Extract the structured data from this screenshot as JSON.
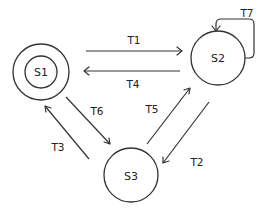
{
  "diagram": {
    "type": "state-transition",
    "states": [
      {
        "id": "S1",
        "label": "S1",
        "cx": 41,
        "cy": 72,
        "r": 28,
        "inner_r": 16,
        "accepting": true
      },
      {
        "id": "S2",
        "label": "S2",
        "cx": 218,
        "cy": 58,
        "r": 27,
        "accepting": false
      },
      {
        "id": "S3",
        "label": "S3",
        "cx": 131,
        "cy": 175,
        "r": 27,
        "accepting": false
      }
    ],
    "transitions": [
      {
        "id": "T1",
        "label": "T1",
        "from": "S1",
        "to": "S2"
      },
      {
        "id": "T2",
        "label": "T2",
        "from": "S2",
        "to": "S3"
      },
      {
        "id": "T3",
        "label": "T3",
        "from": "S3",
        "to": "S1"
      },
      {
        "id": "T4",
        "label": "T4",
        "from": "S2",
        "to": "S1"
      },
      {
        "id": "T5",
        "label": "T5",
        "from": "S3",
        "to": "S2"
      },
      {
        "id": "T6",
        "label": "T6",
        "from": "S1",
        "to": "S3"
      },
      {
        "id": "T7",
        "label": "T7",
        "from": "S2",
        "to": "S2"
      }
    ],
    "colors": {
      "stroke": "#333333",
      "text": "#222222",
      "background": "#ffffff"
    }
  }
}
